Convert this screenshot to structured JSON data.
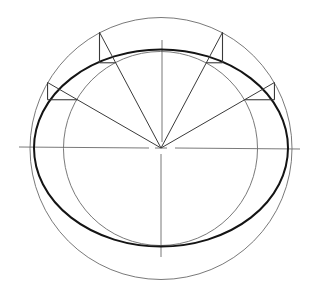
{
  "diagram": {
    "title": "",
    "method": "concentric circles",
    "elements": {
      "outer_circle": "major-axis circle",
      "inner_circle": "minor-axis circle",
      "ellipse": "constructed ellipse",
      "major_axis": "horizontal centerline",
      "minor_axis": "vertical centerline",
      "construction_rays_count": 4,
      "construction_ray_angles_deg": [
        150,
        118,
        62,
        30
      ]
    },
    "ratio": {
      "minor_to_major": 0.76
    },
    "colors": {
      "ellipse": "#141414",
      "circles": "#6a6a6a",
      "rays": "#3a3a3a",
      "background": "#ffffff"
    }
  }
}
